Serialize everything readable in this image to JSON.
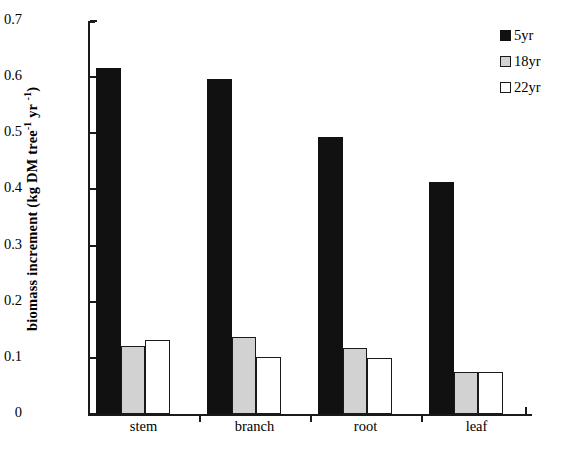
{
  "chart_data": {
    "type": "bar",
    "title": "",
    "xlabel": "",
    "ylabel": "biomass increment (kg DM tree-1 yr -1)",
    "ylabel_parts": {
      "main": "biomass increment (kg DM tree",
      "sup1": "-1",
      "mid": " yr ",
      "sup2": "-1",
      "tail": ")"
    },
    "categories": [
      "stem",
      "branch",
      "root",
      "leaf"
    ],
    "series": [
      {
        "name": "5yr",
        "color": "#111111",
        "values": [
          0.616,
          0.596,
          0.494,
          0.414
        ]
      },
      {
        "name": "18yr",
        "color": "#d2d2d2",
        "values": [
          0.122,
          0.137,
          0.118,
          0.075
        ]
      },
      {
        "name": "22yr",
        "color": "#ffffff",
        "values": [
          0.132,
          0.102,
          0.1,
          0.075
        ]
      }
    ],
    "ylim": [
      0,
      0.7
    ],
    "ytick_labels": [
      "0.7",
      "0.6",
      "0.5",
      "0.4",
      "0.3",
      "0.2",
      "0.1",
      "0"
    ],
    "ytick_values": [
      0.7,
      0.6,
      0.5,
      0.4,
      0.3,
      0.2,
      0.1,
      0
    ],
    "grid": false,
    "legend_position": "top-right",
    "legend_entries": [
      "5yr",
      "18yr",
      "22yr"
    ]
  }
}
